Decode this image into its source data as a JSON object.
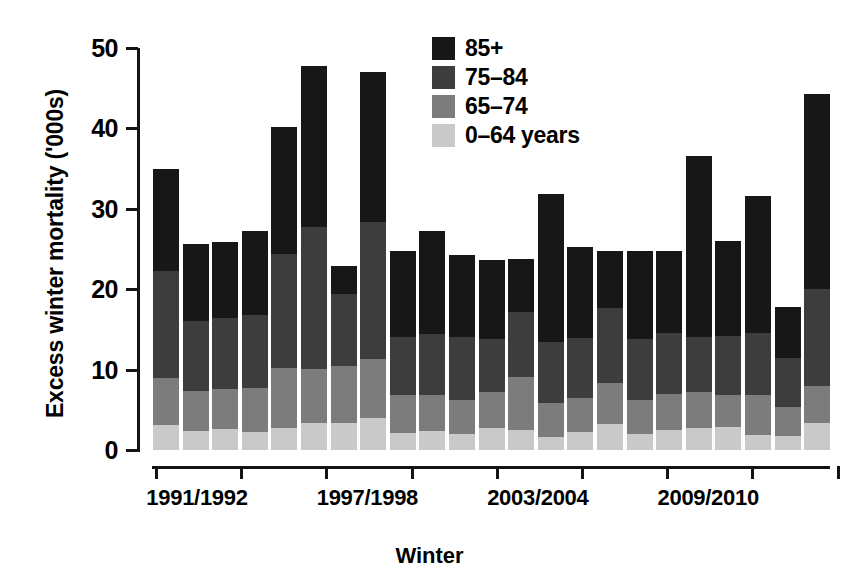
{
  "chart_data": {
    "type": "bar",
    "subtype": "stacked",
    "title": "",
    "xlabel": "Winter",
    "ylabel": "Excess winter mortality ('000s)",
    "ylim": [
      0,
      50
    ],
    "yticks": [
      0,
      10,
      20,
      30,
      40,
      50
    ],
    "ytick_labels": [
      "0",
      "10",
      "20",
      "30",
      "40",
      "50"
    ],
    "grid": false,
    "legend_position": "top-right",
    "x_tick_labels": [
      "1991/1992",
      "1997/1998",
      "2003/2004",
      "2009/2010"
    ],
    "categories": [
      "1991/1992",
      "1992/1993",
      "1993/1994",
      "1994/1995",
      "1995/1996",
      "1996/1997",
      "1997/1998",
      "1998/1999",
      "1999/2000",
      "2000/2001",
      "2001/2002",
      "2002/2003",
      "2003/2004",
      "2004/2005",
      "2005/2006",
      "2006/2007",
      "2007/2008",
      "2008/2009",
      "2009/2010",
      "2010/2011",
      "2011/2012",
      "2012/2013",
      "2013/2014"
    ],
    "series": [
      {
        "name": "0-64 years",
        "color": "#c9c9c9",
        "values": [
          3.1,
          2.4,
          2.6,
          2.3,
          2.7,
          3.3,
          3.4,
          4.0,
          2.1,
          2.4,
          2.0,
          2.8,
          2.5,
          1.6,
          2.2,
          3.2,
          2.0,
          2.5,
          2.8,
          2.9,
          1.9,
          1.7,
          3.4
        ]
      },
      {
        "name": "65-74",
        "color": "#7c7c7c",
        "values": [
          5.9,
          4.9,
          5.0,
          5.4,
          7.5,
          6.8,
          7.0,
          7.3,
          4.8,
          4.5,
          4.2,
          4.4,
          6.6,
          4.3,
          4.3,
          5.1,
          4.2,
          4.5,
          4.4,
          3.9,
          4.9,
          3.6,
          4.6
        ]
      },
      {
        "name": "75-84",
        "color": "#3d3d3d",
        "values": [
          13.3,
          8.8,
          8.8,
          9.1,
          14.2,
          17.7,
          9.0,
          17.0,
          7.1,
          7.5,
          7.8,
          6.6,
          8.1,
          7.5,
          7.4,
          9.4,
          7.6,
          7.5,
          6.8,
          7.4,
          7.7,
          6.1,
          12.0
        ]
      },
      {
        "name": "85+",
        "color": "#171717",
        "values": [
          12.7,
          9.5,
          9.5,
          10.5,
          15.8,
          20.0,
          3.5,
          18.7,
          10.8,
          12.9,
          10.2,
          9.8,
          6.5,
          18.5,
          11.4,
          7.1,
          11.0,
          10.3,
          22.6,
          11.8,
          17.1,
          6.4,
          24.3
        ]
      }
    ],
    "totals": [
      35.0,
      25.6,
      25.9,
      27.3,
      40.2,
      47.8,
      22.9,
      47.0,
      24.8,
      27.3,
      24.2,
      23.6,
      23.7,
      31.9,
      25.3,
      24.8,
      24.8,
      24.8,
      36.6,
      26.0,
      26.2,
      24.3,
      17.7
    ]
  },
  "axes": {
    "y_title": "Excess winter mortality ('000s)",
    "x_title": "Winter",
    "y_tick_labels": [
      "50",
      "40",
      "30",
      "20",
      "10",
      "0"
    ],
    "x_tick_labels": [
      "1991/1992",
      "1997/1998",
      "2003/2004",
      "2009/2010"
    ]
  },
  "legend": {
    "items": [
      {
        "label": "85+",
        "color": "#171717"
      },
      {
        "label": "75–84",
        "color": "#3d3d3d"
      },
      {
        "label": "65–74",
        "color": "#7c7c7c"
      },
      {
        "label": "0–64 years",
        "color": "#c9c9c9"
      }
    ]
  },
  "colors": {
    "axis": "#141414",
    "background": "#ffffff",
    "band_85_plus": "#171717",
    "band_75_84": "#3d3d3d",
    "band_65_74": "#7c7c7c",
    "band_0_64": "#c9c9c9"
  }
}
